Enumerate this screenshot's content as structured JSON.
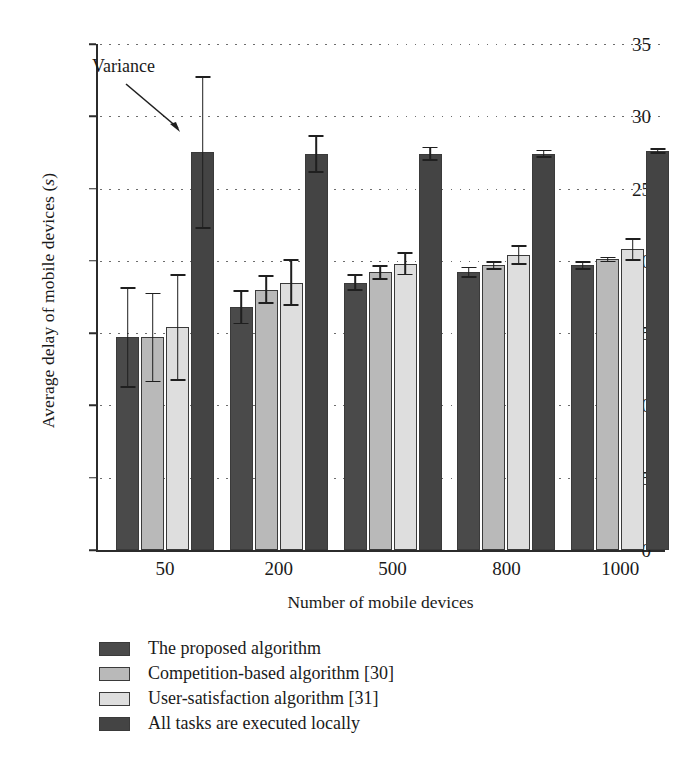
{
  "chart_data": {
    "type": "bar",
    "title": "",
    "subtitle": "",
    "xlabel": "Number of mobile devices",
    "ylabel": "Average delay of mobile devices (s)",
    "ylabel_plain": "Average delay of mobile devices",
    "ylabel_unit": "s",
    "categories": [
      "50",
      "200",
      "500",
      "800",
      "1000"
    ],
    "ylim": [
      0,
      35
    ],
    "ytick_values": [
      0,
      5,
      10,
      15,
      20,
      25,
      30,
      35
    ],
    "ytick_labels": [
      "0",
      "5",
      "10",
      "15",
      "20",
      "25",
      "30",
      "35"
    ],
    "grid": true,
    "grid_style": "dotted-horizontal",
    "legend_position": "below-plot-left",
    "orientation": "vertical",
    "series": [
      {
        "name": "The proposed algorithm",
        "color": "#4a4a4a",
        "values": [
          14.7,
          16.8,
          18.5,
          19.2,
          19.7
        ],
        "errors": [
          3.5,
          1.2,
          0.6,
          0.4,
          0.3
        ]
      },
      {
        "name": "Competition-based algorithm [30]",
        "color": "#b9b9b9",
        "values": [
          14.7,
          18.0,
          19.2,
          19.7,
          20.1
        ],
        "errors": [
          3.1,
          1.0,
          0.5,
          0.3,
          0.2
        ]
      },
      {
        "name": "User-satisfaction algorithm [31]",
        "color": "#dedede",
        "values": [
          15.4,
          18.5,
          19.8,
          20.4,
          20.8
        ],
        "errors": [
          3.7,
          1.6,
          0.8,
          0.7,
          0.8
        ]
      },
      {
        "name": "All tasks are executed locally",
        "color": "#444444",
        "values": [
          27.5,
          27.4,
          27.4,
          27.4,
          27.6
        ],
        "errors": [
          5.3,
          1.3,
          0.5,
          0.3,
          0.2
        ]
      }
    ],
    "annotations": [
      {
        "text": "Variance",
        "points_to": "error bar of 'All tasks are executed locally' at category 50",
        "arrow": true
      }
    ]
  },
  "legend": {
    "items": [
      {
        "label": "The proposed algorithm",
        "color": "#4a4a4a"
      },
      {
        "label": "Competition-based algorithm [30]",
        "color": "#b9b9b9"
      },
      {
        "label": "User-satisfaction algorithm [31]",
        "color": "#dedede"
      },
      {
        "label": "All tasks are executed locally",
        "color": "#444444"
      }
    ]
  },
  "axes": {
    "y_title_main": "Average delay of mobile devices (",
    "y_title_unit": "s",
    "y_title_tail": ")",
    "x_title": "Number of mobile devices"
  }
}
